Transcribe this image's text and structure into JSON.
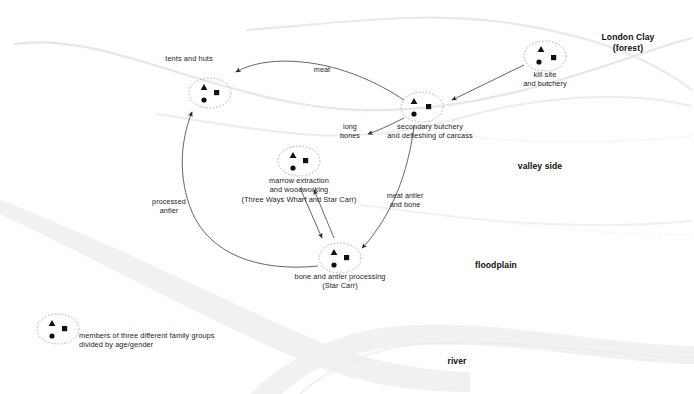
{
  "figure": {
    "kind": "archaeological-site-activity-diagram",
    "background": "#ffffff",
    "width": 694,
    "height": 394
  },
  "colors": {
    "ink": "#1c1c1c",
    "terrain_band": "#f1f1f1",
    "terrain_line": "#e2e2e2",
    "arrow": "#4a4a4a",
    "node_outline": "#8a8a8a"
  },
  "terrain_labels": [
    {
      "name": "london-clay",
      "text": "London Clay\n(forest)",
      "x": 628,
      "y": 38
    },
    {
      "name": "valley-side",
      "text": "valley side",
      "x": 540,
      "y": 166
    },
    {
      "name": "floodplain",
      "text": "floodplain",
      "x": 496,
      "y": 265
    },
    {
      "name": "river",
      "text": "river",
      "x": 457,
      "y": 361
    }
  ],
  "nodes": [
    {
      "id": "kill-site",
      "label": "kill site\nand butchery",
      "cx": 545,
      "cy": 56,
      "rx": 21,
      "ry": 15,
      "label_x": 545,
      "label_y": 76
    },
    {
      "id": "secondary-butchery",
      "label": "secondary butchery\nand defleshing of carcass",
      "cx": 422,
      "cy": 107,
      "rx": 21,
      "ry": 15,
      "label_x": 430,
      "label_y": 127
    },
    {
      "id": "tents-and-huts",
      "label": "tents and huts",
      "cx": 210,
      "cy": 93,
      "rx": 21,
      "ry": 15,
      "label_x": 189,
      "label_y": 58
    },
    {
      "id": "marrow-extraction",
      "label": "marrow extraction\nand woodworking\n(Three Ways Wharf and Star Carr)",
      "cx": 299,
      "cy": 161,
      "rx": 21,
      "ry": 15,
      "label_x": 299,
      "label_y": 181
    },
    {
      "id": "bone-antler-processing",
      "label": "bone and antler processing\n(Star Carr)",
      "cx": 340,
      "cy": 258,
      "rx": 21,
      "ry": 15,
      "label_x": 340,
      "label_y": 277
    },
    {
      "id": "family-groups-legend",
      "label": "members of three different family groups\ndivided by age/gender",
      "cx": 58,
      "cy": 329,
      "rx": 21,
      "ry": 15,
      "label_x": 79,
      "label_y": 336
    }
  ],
  "flow_labels": [
    {
      "name": "meat",
      "text": "meat",
      "x": 322,
      "y": 69
    },
    {
      "name": "long-bones",
      "text": "long\nbones",
      "x": 350,
      "y": 127
    },
    {
      "name": "processed-antler",
      "text": "processed\nantler",
      "x": 169,
      "y": 202
    },
    {
      "name": "meat-antler-and-bone",
      "text": "meat antler\nand bone",
      "x": 404,
      "y": 196
    }
  ],
  "arrows": [
    {
      "name": "kill-site-to-secondary-butchery",
      "from": "kill-site",
      "to": "secondary-butchery",
      "carries": ""
    },
    {
      "name": "secondary-butchery-to-tents",
      "from": "secondary-butchery",
      "to": "tents-and-huts",
      "carries": "meat"
    },
    {
      "name": "secondary-butchery-to-marrow",
      "from": "secondary-butchery",
      "to": "marrow-extraction",
      "carries": "long bones"
    },
    {
      "name": "secondary-butchery-to-bone-antler",
      "from": "secondary-butchery",
      "to": "bone-antler-processing",
      "carries": "meat antler and bone"
    },
    {
      "name": "marrow-to-bone-antler",
      "from": "marrow-extraction",
      "to": "bone-antler-processing",
      "carries": ""
    },
    {
      "name": "bone-antler-to-marrow",
      "from": "bone-antler-processing",
      "to": "marrow-extraction",
      "carries": ""
    },
    {
      "name": "bone-antler-to-tents",
      "from": "bone-antler-processing",
      "to": "tents-and-huts",
      "carries": "processed antler"
    }
  ],
  "node_markers": {
    "triangle": "family-group-a",
    "circle": "family-group-b",
    "square": "family-group-c"
  }
}
